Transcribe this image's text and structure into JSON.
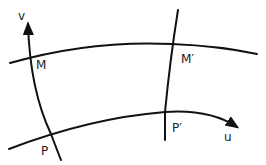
{
  "diagram": {
    "type": "curvilinear coordinate grid",
    "line_color": "#111111",
    "background": "#ffffff",
    "curves": {
      "upper_u_curve": "M 10 63 Q 90 40 172 44 Q 220 46 257 54",
      "lower_u_curve": "M 9 149 Q 90 118 165 112 Q 210 109 237 127",
      "left_v_curve": "M 28 24 Q 30 90 51 134 Q 57 150 61 160",
      "right_v_curve": "M 178 10 Q 170 60 165 112 L 165 140"
    },
    "axes": {
      "u": {
        "label": "u",
        "x": 224,
        "y": 141
      },
      "v": {
        "label": "v",
        "x": 18,
        "y": 20
      }
    },
    "points": [
      {
        "label": "M",
        "x": 36,
        "y": 69
      },
      {
        "label": "M′",
        "x": 181,
        "y": 63
      },
      {
        "label": "P",
        "x": 41,
        "y": 155
      },
      {
        "label": "P′",
        "x": 172,
        "y": 132
      }
    ]
  }
}
